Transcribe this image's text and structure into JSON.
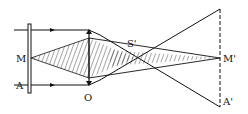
{
  "diagram": {
    "type": "optics-ray-diagram",
    "labels": {
      "M": "M",
      "A": "A",
      "O": "O",
      "S_prime": "S'",
      "M_prime": "M'",
      "A_prime": "A'"
    },
    "colors": {
      "stroke": "#111111",
      "background": "#ffffff"
    }
  }
}
